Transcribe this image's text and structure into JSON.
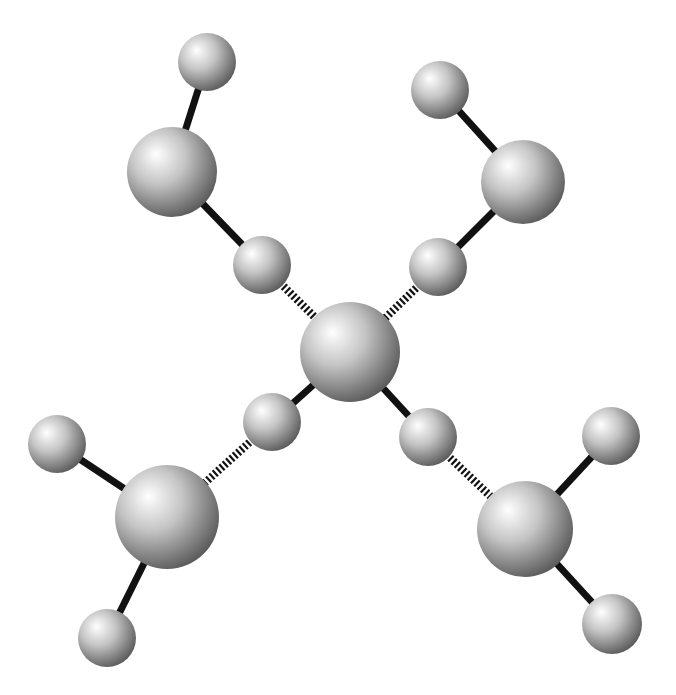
{
  "diagram": {
    "type": "ball-and-stick molecular model",
    "background": "#ffffff",
    "colors": {
      "atom_highlight": "#ffffff",
      "atom_mid": "#c4c4c4",
      "atom_shadow": "#5a5a5a",
      "bond": "#111111"
    },
    "atoms": [
      {
        "id": "center",
        "x": 350,
        "y": 352,
        "r": 50,
        "kind": "large"
      },
      {
        "id": "tl-large",
        "x": 172,
        "y": 172,
        "r": 45,
        "kind": "large"
      },
      {
        "id": "tl-h-outer",
        "x": 207,
        "y": 62,
        "r": 29,
        "kind": "small"
      },
      {
        "id": "tl-h-inner",
        "x": 262,
        "y": 265,
        "r": 29,
        "kind": "small"
      },
      {
        "id": "tr-large",
        "x": 523,
        "y": 182,
        "r": 42,
        "kind": "large"
      },
      {
        "id": "tr-h-outer",
        "x": 440,
        "y": 90,
        "r": 29,
        "kind": "small"
      },
      {
        "id": "tr-h-inner",
        "x": 438,
        "y": 267,
        "r": 29,
        "kind": "small"
      },
      {
        "id": "bl-large",
        "x": 167,
        "y": 517,
        "r": 52,
        "kind": "large"
      },
      {
        "id": "bl-h-left",
        "x": 57,
        "y": 444,
        "r": 29,
        "kind": "small"
      },
      {
        "id": "bl-h-bottom",
        "x": 107,
        "y": 638,
        "r": 29,
        "kind": "small"
      },
      {
        "id": "c-h-bl",
        "x": 272,
        "y": 422,
        "r": 29,
        "kind": "small"
      },
      {
        "id": "br-large",
        "x": 525,
        "y": 529,
        "r": 48,
        "kind": "large"
      },
      {
        "id": "br-h-right",
        "x": 611,
        "y": 436,
        "r": 29,
        "kind": "small"
      },
      {
        "id": "br-h-bottom",
        "x": 612,
        "y": 624,
        "r": 30,
        "kind": "small"
      },
      {
        "id": "c-h-br",
        "x": 428,
        "y": 437,
        "r": 29,
        "kind": "small"
      }
    ],
    "bonds": [
      {
        "a": "tl-large",
        "b": "tl-h-outer",
        "style": "solid"
      },
      {
        "a": "tl-large",
        "b": "tl-h-inner",
        "style": "solid"
      },
      {
        "a": "tl-h-inner",
        "b": "center",
        "style": "hashed"
      },
      {
        "a": "tr-large",
        "b": "tr-h-outer",
        "style": "solid"
      },
      {
        "a": "tr-large",
        "b": "tr-h-inner",
        "style": "solid"
      },
      {
        "a": "tr-h-inner",
        "b": "center",
        "style": "hashed"
      },
      {
        "a": "center",
        "b": "c-h-bl",
        "style": "solid"
      },
      {
        "a": "c-h-bl",
        "b": "bl-large",
        "style": "hashed"
      },
      {
        "a": "bl-large",
        "b": "bl-h-left",
        "style": "solid"
      },
      {
        "a": "bl-large",
        "b": "bl-h-bottom",
        "style": "solid"
      },
      {
        "a": "center",
        "b": "c-h-br",
        "style": "solid"
      },
      {
        "a": "c-h-br",
        "b": "br-large",
        "style": "hashed"
      },
      {
        "a": "br-large",
        "b": "br-h-right",
        "style": "solid"
      },
      {
        "a": "br-large",
        "b": "br-h-bottom",
        "style": "solid"
      }
    ]
  }
}
